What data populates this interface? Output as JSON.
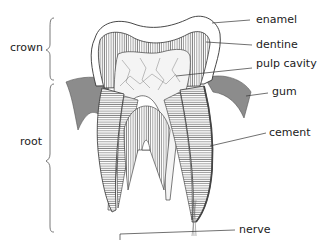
{
  "diagram": {
    "regions": [
      {
        "id": "crown",
        "label": "crown"
      },
      {
        "id": "root",
        "label": "root"
      }
    ],
    "labels": [
      {
        "id": "enamel",
        "label": "enamel"
      },
      {
        "id": "dentine",
        "label": "dentine"
      },
      {
        "id": "pulp-cavity",
        "label": "pulp cavity"
      },
      {
        "id": "gum",
        "label": "gum"
      },
      {
        "id": "cement",
        "label": "cement"
      },
      {
        "id": "nerve",
        "label": "nerve"
      }
    ],
    "colors": {
      "outline": "#333333",
      "gum": "#8c8c8c",
      "hatch": "#555555",
      "background": "#ffffff"
    }
  }
}
